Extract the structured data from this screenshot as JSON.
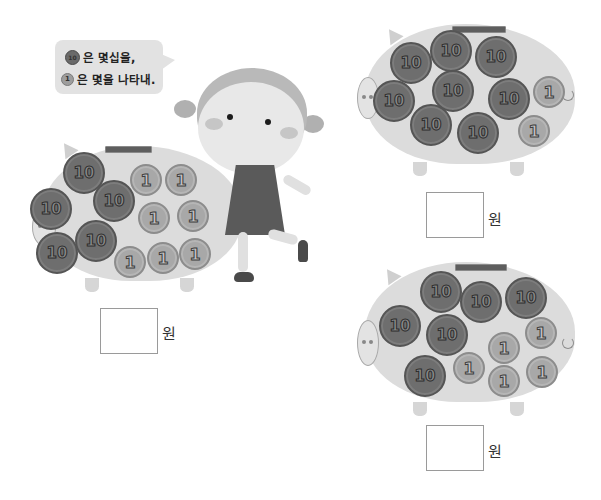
{
  "bubble": {
    "line1_coin": "10",
    "line1_text": "은 몇십을,",
    "line2_coin": "1",
    "line2_text": "은 몇을 나타내."
  },
  "unit_label": "원",
  "piggy_banks": [
    {
      "id": "left",
      "tens_count": 5,
      "ones_count": 7,
      "ten_label": "10",
      "one_label": "1",
      "answer_value": "",
      "unit": "원"
    },
    {
      "id": "top-right",
      "tens_count": 8,
      "ones_count": 2,
      "ten_label": "10",
      "one_label": "1",
      "answer_value": "",
      "unit": "원"
    },
    {
      "id": "bottom-right",
      "tens_count": 6,
      "ones_count": 5,
      "ten_label": "10",
      "one_label": "1",
      "answer_value": "",
      "unit": "원"
    }
  ],
  "colors": {
    "pig_body": "#dcdcdc",
    "ten_coin": "#6e6e6e",
    "one_coin": "#a8a8a8",
    "bubble": "#e2e2e2"
  }
}
